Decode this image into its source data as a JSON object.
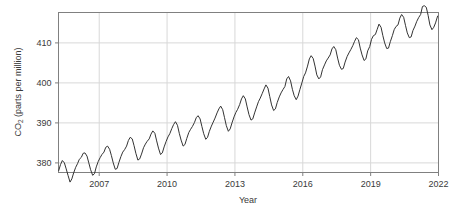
{
  "chart_data": {
    "type": "line",
    "title": "",
    "xlabel": "Year",
    "ylabel": "CO2 (parts per million)",
    "ylabel_prefix": "CO",
    "ylabel_subscript": "2",
    "ylabel_suffix": " (parts per million)",
    "xlim": [
      2005.2,
      2022.0
    ],
    "ylim": [
      377.6,
      417.6
    ],
    "xticks": [
      2007,
      2010,
      2013,
      2016,
      2019,
      2022
    ],
    "xtick_labels": [
      "2007",
      "2010",
      "2013",
      "2016",
      "2019",
      "2022"
    ],
    "yticks": [
      380,
      390,
      400,
      410
    ],
    "ytick_labels": [
      "380",
      "390",
      "400",
      "410"
    ],
    "grid": true,
    "legend": "none",
    "line_color": "#333333",
    "grid_color": "#d8d8d8",
    "frame_color": "#808080",
    "background_color": "#ffffff",
    "series": [
      {
        "name": "Monthly mean CO2",
        "x": [
          2005.21,
          2005.29,
          2005.37,
          2005.46,
          2005.54,
          2005.62,
          2005.71,
          2005.79,
          2005.87,
          2005.96,
          2006.04,
          2006.12,
          2006.21,
          2006.29,
          2006.37,
          2006.46,
          2006.54,
          2006.62,
          2006.71,
          2006.79,
          2006.87,
          2006.96,
          2007.04,
          2007.12,
          2007.21,
          2007.29,
          2007.37,
          2007.46,
          2007.54,
          2007.62,
          2007.71,
          2007.79,
          2007.87,
          2007.96,
          2008.04,
          2008.12,
          2008.21,
          2008.29,
          2008.37,
          2008.46,
          2008.54,
          2008.62,
          2008.71,
          2008.79,
          2008.87,
          2008.96,
          2009.04,
          2009.12,
          2009.21,
          2009.29,
          2009.37,
          2009.46,
          2009.54,
          2009.62,
          2009.71,
          2009.79,
          2009.87,
          2009.96,
          2010.04,
          2010.12,
          2010.21,
          2010.29,
          2010.37,
          2010.46,
          2010.54,
          2010.62,
          2010.71,
          2010.79,
          2010.87,
          2010.96,
          2011.04,
          2011.12,
          2011.21,
          2011.29,
          2011.37,
          2011.46,
          2011.54,
          2011.62,
          2011.71,
          2011.79,
          2011.87,
          2011.96,
          2012.04,
          2012.12,
          2012.21,
          2012.29,
          2012.37,
          2012.46,
          2012.54,
          2012.62,
          2012.71,
          2012.79,
          2012.87,
          2012.96,
          2013.04,
          2013.12,
          2013.21,
          2013.29,
          2013.37,
          2013.46,
          2013.54,
          2013.62,
          2013.71,
          2013.79,
          2013.87,
          2013.96,
          2014.04,
          2014.12,
          2014.21,
          2014.29,
          2014.37,
          2014.46,
          2014.54,
          2014.62,
          2014.71,
          2014.79,
          2014.87,
          2014.96,
          2015.04,
          2015.12,
          2015.21,
          2015.29,
          2015.37,
          2015.46,
          2015.54,
          2015.62,
          2015.71,
          2015.79,
          2015.87,
          2015.96,
          2016.04,
          2016.12,
          2016.21,
          2016.29,
          2016.37,
          2016.46,
          2016.54,
          2016.62,
          2016.71,
          2016.79,
          2016.87,
          2016.96,
          2017.04,
          2017.12,
          2017.21,
          2017.29,
          2017.37,
          2017.46,
          2017.54,
          2017.62,
          2017.71,
          2017.79,
          2017.87,
          2017.96,
          2018.04,
          2018.12,
          2018.21,
          2018.29,
          2018.37,
          2018.46,
          2018.54,
          2018.62,
          2018.71,
          2018.79,
          2018.87,
          2018.96,
          2019.04,
          2019.12,
          2019.21,
          2019.29,
          2019.37,
          2019.46,
          2019.54,
          2019.62,
          2019.71,
          2019.79,
          2019.87,
          2019.96,
          2020.04,
          2020.12,
          2020.21,
          2020.29,
          2020.37,
          2020.46,
          2020.54,
          2020.62,
          2020.71,
          2020.79,
          2020.87,
          2020.96,
          2021.04,
          2021.12,
          2021.21,
          2021.29,
          2021.37,
          2021.46,
          2021.54,
          2021.62,
          2021.71,
          2021.79,
          2021.87,
          2021.96
        ],
        "y": [
          378.1,
          379.6,
          380.6,
          380.0,
          378.5,
          376.9,
          375.2,
          376.0,
          377.5,
          378.9,
          379.8,
          380.9,
          381.4,
          382.4,
          382.5,
          381.7,
          380.0,
          378.3,
          376.9,
          377.3,
          379.0,
          380.4,
          381.3,
          382.1,
          382.7,
          383.9,
          384.2,
          383.4,
          381.8,
          380.0,
          378.4,
          378.6,
          380.1,
          381.6,
          382.7,
          383.3,
          384.2,
          385.6,
          386.4,
          386.0,
          384.3,
          382.4,
          380.7,
          381.0,
          382.2,
          383.8,
          384.7,
          385.4,
          386.0,
          387.2,
          388.0,
          387.4,
          385.5,
          383.7,
          382.1,
          382.5,
          384.0,
          385.4,
          386.5,
          387.3,
          388.6,
          389.6,
          390.3,
          389.4,
          387.4,
          385.7,
          384.2,
          384.6,
          386.1,
          387.6,
          388.4,
          389.1,
          390.1,
          391.3,
          391.8,
          391.0,
          389.1,
          387.3,
          385.9,
          386.4,
          387.9,
          389.2,
          390.2,
          391.2,
          392.5,
          393.5,
          394.2,
          393.3,
          391.3,
          389.3,
          387.9,
          388.5,
          390.0,
          391.5,
          392.6,
          393.4,
          394.6,
          396.0,
          396.8,
          396.0,
          394.0,
          392.1,
          390.7,
          391.0,
          392.5,
          394.0,
          395.3,
          396.2,
          397.4,
          398.5,
          399.5,
          398.7,
          396.6,
          394.5,
          393.1,
          393.5,
          395.1,
          396.5,
          397.5,
          398.3,
          399.1,
          401.0,
          401.6,
          400.5,
          398.4,
          396.8,
          395.8,
          396.7,
          398.3,
          400.0,
          401.6,
          402.5,
          404.2,
          406.0,
          406.8,
          406.1,
          404.2,
          402.0,
          401.0,
          401.5,
          403.3,
          404.5,
          405.5,
          406.2,
          407.0,
          408.5,
          409.1,
          408.3,
          406.2,
          404.4,
          403.4,
          403.6,
          405.2,
          406.6,
          407.5,
          408.3,
          409.3,
          410.4,
          411.3,
          410.8,
          408.7,
          407.0,
          405.6,
          406.0,
          408.0,
          409.1,
          410.9,
          411.8,
          412.1,
          413.4,
          414.7,
          413.9,
          411.8,
          410.0,
          408.6,
          408.7,
          410.3,
          411.8,
          413.3,
          414.1,
          414.5,
          416.2,
          417.1,
          416.4,
          414.4,
          412.5,
          411.3,
          411.5,
          413.1,
          414.2,
          415.4,
          416.3,
          417.1,
          419.1,
          419.3,
          418.9,
          416.9,
          414.5,
          413.3,
          413.9,
          415.0,
          416.7
        ]
      }
    ]
  },
  "annotations": {}
}
